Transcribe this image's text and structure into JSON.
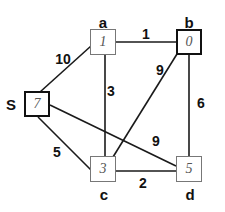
{
  "graph": {
    "nodes": [
      {
        "id": "S",
        "label": "S",
        "value": "7",
        "emphasis": "thick"
      },
      {
        "id": "a",
        "label": "a",
        "value": "1",
        "emphasis": "thin"
      },
      {
        "id": "b",
        "label": "b",
        "value": "0",
        "emphasis": "thick"
      },
      {
        "id": "c",
        "label": "c",
        "value": "3",
        "emphasis": "thin"
      },
      {
        "id": "d",
        "label": "d",
        "value": "5",
        "emphasis": "thin"
      }
    ],
    "edges": [
      {
        "from": "S",
        "to": "a",
        "weight": "10"
      },
      {
        "from": "a",
        "to": "b",
        "weight": "1"
      },
      {
        "from": "a",
        "to": "c",
        "weight": "3"
      },
      {
        "from": "b",
        "to": "c",
        "weight": "9"
      },
      {
        "from": "b",
        "to": "d",
        "weight": "6"
      },
      {
        "from": "S",
        "to": "d",
        "weight": "9"
      },
      {
        "from": "S",
        "to": "c",
        "weight": "5"
      },
      {
        "from": "c",
        "to": "d",
        "weight": "2"
      }
    ]
  }
}
